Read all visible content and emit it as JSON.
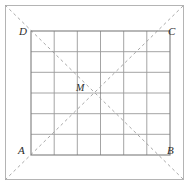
{
  "figure": {
    "kind": "geometry-diagram",
    "labels": {
      "top_left": "D",
      "top_right": "C",
      "bottom_left": "A",
      "bottom_right": "B",
      "center": "M"
    },
    "grid": {
      "columns": 6,
      "rows": 6,
      "left": 31,
      "top": 31,
      "right": 170,
      "bottom": 155
    },
    "outer_border": {
      "left": 5,
      "top": 5,
      "right": 184,
      "bottom": 180
    },
    "diagonals": [
      {
        "name": "A-to-C",
        "from": "A",
        "to": "C",
        "style": "dashed"
      },
      {
        "name": "D-to-B",
        "from": "D",
        "to": "B",
        "style": "dashed"
      }
    ],
    "colors": {
      "grid_line": "#9a9a9a",
      "square_outline": "#7d7d7d",
      "diagonal": "#a9a9a9",
      "outer_border": "#b4b4b4",
      "label_text": "#2b2b2b",
      "background": "#ffffff"
    }
  }
}
